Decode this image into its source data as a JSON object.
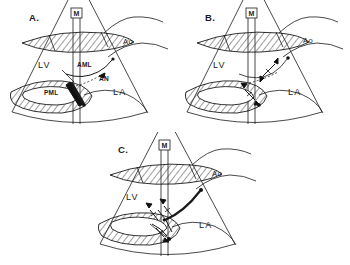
{
  "figure": {
    "background_color": "#ffffff",
    "ink_color": "#1a1a1a"
  },
  "panels": [
    {
      "id": "A",
      "label": "A.",
      "cursor_label": "M",
      "chambers": [
        {
          "name": "left-ventricle",
          "label": "LV"
        },
        {
          "name": "left-atrium",
          "label": "LA"
        },
        {
          "name": "aorta",
          "label": "Ao"
        }
      ],
      "leaflets": [
        {
          "name": "anterior-mitral-leaflet",
          "label": "AML"
        },
        {
          "name": "posterior-mitral-leaflet",
          "label": "PML"
        },
        {
          "name": "annulus",
          "label": "AN"
        }
      ]
    },
    {
      "id": "B",
      "label": "B.",
      "cursor_label": "M",
      "chambers": [
        {
          "name": "left-ventricle",
          "label": "LV"
        },
        {
          "name": "left-atrium",
          "label": "LA"
        },
        {
          "name": "aorta",
          "label": "Ao"
        }
      ],
      "leaflets": []
    },
    {
      "id": "C",
      "label": "C.",
      "cursor_label": "M",
      "chambers": [
        {
          "name": "left-ventricle",
          "label": "LV"
        },
        {
          "name": "left-atrium",
          "label": "LA"
        },
        {
          "name": "aorta",
          "label": "Ao"
        }
      ],
      "leaflets": []
    }
  ]
}
